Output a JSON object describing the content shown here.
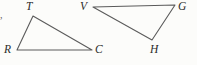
{
  "figure": {
    "background_color": "#fcfcfa",
    "stroke_color": "#5b5b5b",
    "label_color": "#2b2b2b",
    "stray_mark": ",",
    "triangles": [
      {
        "name": "triangle-rtc",
        "vertices": [
          {
            "label": "T",
            "x": 33,
            "y": 16,
            "label_x": 26,
            "label_y": 1
          },
          {
            "label": "C",
            "x": 92,
            "y": 50,
            "label_x": 95,
            "label_y": 44
          },
          {
            "label": "R",
            "x": 17,
            "y": 50,
            "label_x": 4,
            "label_y": 44
          }
        ]
      },
      {
        "name": "triangle-vgh",
        "vertices": [
          {
            "label": "V",
            "x": 93,
            "y": 7,
            "label_x": 80,
            "label_y": 1
          },
          {
            "label": "G",
            "x": 175,
            "y": 5,
            "label_x": 178,
            "label_y": 1
          },
          {
            "label": "H",
            "x": 152,
            "y": 40,
            "label_x": 150,
            "label_y": 44
          }
        ]
      }
    ]
  }
}
